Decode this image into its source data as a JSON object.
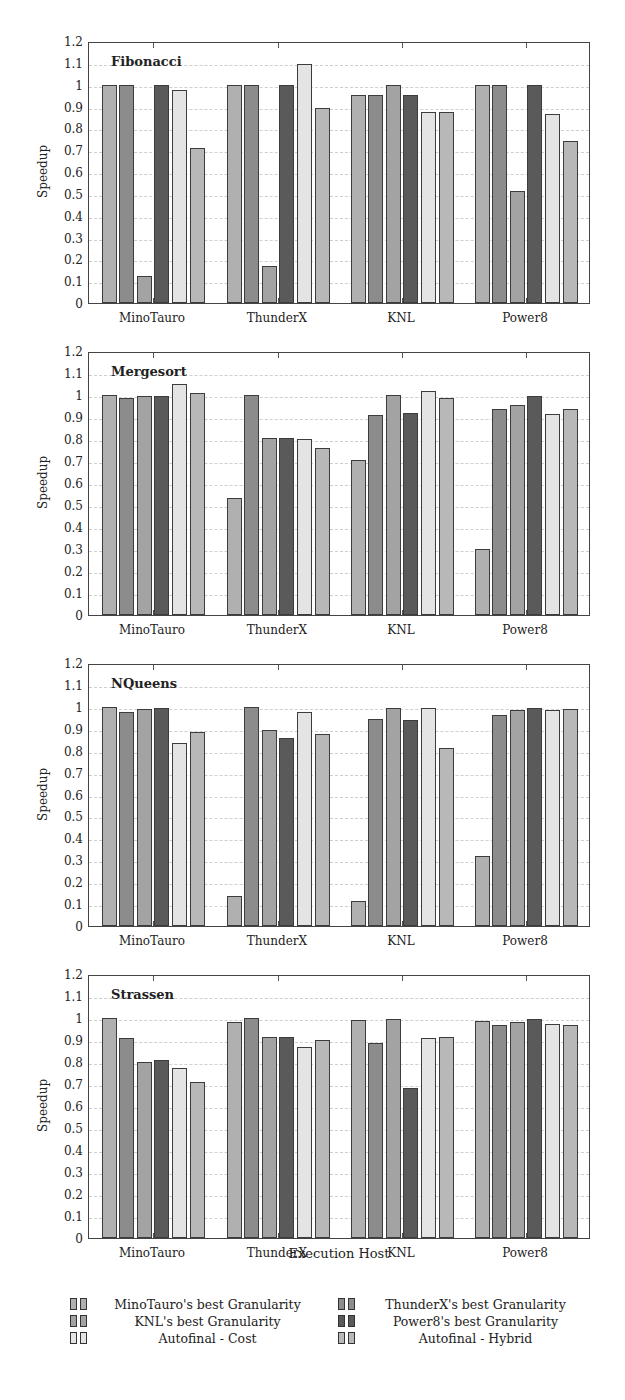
{
  "chart_data": [
    {
      "type": "bar",
      "title": "Fibonacci",
      "xlabel": "",
      "ylabel": "Speedup",
      "ylim": [
        0,
        1.2
      ],
      "yticks": [
        "0",
        "0.1",
        "0.2",
        "0.3",
        "0.4",
        "0.5",
        "0.6",
        "0.7",
        "0.8",
        "0.9",
        "1",
        "1.1",
        "1.2"
      ],
      "grid": true,
      "categories": [
        "MinoTauro",
        "ThunderX",
        "KNL",
        "Power8"
      ],
      "series": [
        {
          "name": "MinoTauro's best Granularity",
          "values": [
            1.0,
            1.0,
            0.955,
            1.0
          ]
        },
        {
          "name": "ThunderX's best Granularity",
          "values": [
            1.0,
            1.0,
            0.955,
            1.0
          ]
        },
        {
          "name": "KNL's best Granularity",
          "values": [
            0.125,
            0.17,
            1.0,
            0.515
          ]
        },
        {
          "name": "Power8's best Granularity",
          "values": [
            1.0,
            1.0,
            0.955,
            1.0
          ]
        },
        {
          "name": "Autofinal - Cost",
          "values": [
            0.975,
            1.095,
            0.875,
            0.865
          ]
        },
        {
          "name": "Autofinal - Hybrid",
          "values": [
            0.71,
            0.895,
            0.875,
            0.74
          ]
        }
      ]
    },
    {
      "type": "bar",
      "title": "Mergesort",
      "xlabel": "",
      "ylabel": "Speedup",
      "ylim": [
        0,
        1.2
      ],
      "yticks": [
        "0",
        "0.1",
        "0.2",
        "0.3",
        "0.4",
        "0.5",
        "0.6",
        "0.7",
        "0.8",
        "0.9",
        "1",
        "1.1",
        "1.2"
      ],
      "grid": true,
      "categories": [
        "MinoTauro",
        "ThunderX",
        "KNL",
        "Power8"
      ],
      "series": [
        {
          "name": "MinoTauro's best Granularity",
          "values": [
            1.0,
            0.53,
            0.705,
            0.3
          ]
        },
        {
          "name": "ThunderX's best Granularity",
          "values": [
            0.985,
            1.0,
            0.91,
            0.935
          ]
        },
        {
          "name": "KNL's best Granularity",
          "values": [
            0.997,
            0.805,
            1.0,
            0.955
          ]
        },
        {
          "name": "Power8's best Granularity",
          "values": [
            0.997,
            0.805,
            0.92,
            0.995
          ]
        },
        {
          "name": "Autofinal - Cost",
          "values": [
            1.05,
            0.8,
            1.02,
            0.915
          ]
        },
        {
          "name": "Autofinal - Hybrid",
          "values": [
            1.01,
            0.76,
            0.985,
            0.935
          ]
        }
      ]
    },
    {
      "type": "bar",
      "title": "NQueens",
      "xlabel": "",
      "ylabel": "Speedup",
      "ylim": [
        0,
        1.2
      ],
      "yticks": [
        "0",
        "0.1",
        "0.2",
        "0.3",
        "0.4",
        "0.5",
        "0.6",
        "0.7",
        "0.8",
        "0.9",
        "1",
        "1.1",
        "1.2"
      ],
      "grid": true,
      "categories": [
        "MinoTauro",
        "ThunderX",
        "KNL",
        "Power8"
      ],
      "series": [
        {
          "name": "MinoTauro's best Granularity",
          "values": [
            1.0,
            0.135,
            0.115,
            0.32
          ]
        },
        {
          "name": "ThunderX's best Granularity",
          "values": [
            0.975,
            1.0,
            0.945,
            0.965
          ]
        },
        {
          "name": "KNL's best Granularity",
          "values": [
            0.99,
            0.895,
            0.995,
            0.985
          ]
        },
        {
          "name": "Power8's best Granularity",
          "values": [
            0.995,
            0.86,
            0.94,
            0.995
          ]
        },
        {
          "name": "Autofinal - Cost",
          "values": [
            0.835,
            0.975,
            0.995,
            0.985
          ]
        },
        {
          "name": "Autofinal - Hybrid",
          "values": [
            0.885,
            0.875,
            0.81,
            0.99
          ]
        }
      ]
    },
    {
      "type": "bar",
      "title": "Strassen",
      "xlabel": "Execution Host",
      "ylabel": "Speedup",
      "ylim": [
        0,
        1.2
      ],
      "yticks": [
        "0",
        "0.1",
        "0.2",
        "0.3",
        "0.4",
        "0.5",
        "0.6",
        "0.7",
        "0.8",
        "0.9",
        "1",
        "1.1",
        "1.2"
      ],
      "grid": true,
      "categories": [
        "MinoTauro",
        "ThunderX",
        "KNL",
        "Power8"
      ],
      "series": [
        {
          "name": "MinoTauro's best Granularity",
          "values": [
            1.0,
            0.98,
            0.99,
            0.985
          ]
        },
        {
          "name": "ThunderX's best Granularity",
          "values": [
            0.91,
            1.0,
            0.885,
            0.97
          ]
        },
        {
          "name": "KNL's best Granularity",
          "values": [
            0.8,
            0.915,
            0.995,
            0.98
          ]
        },
        {
          "name": "Power8's best Granularity",
          "values": [
            0.81,
            0.915,
            0.68,
            0.995
          ]
        },
        {
          "name": "Autofinal - Cost",
          "values": [
            0.775,
            0.87,
            0.91,
            0.975
          ]
        },
        {
          "name": "Autofinal - Hybrid",
          "values": [
            0.71,
            0.9,
            0.915,
            0.97
          ]
        }
      ]
    }
  ],
  "series_colors": [
    "#b0b0b0",
    "#8c8c8c",
    "#a3a3a3",
    "#5a5a5a",
    "#e4e4e4",
    "#b8b8b8"
  ],
  "legend": {
    "position": "bottom",
    "items": [
      "MinoTauro's best Granularity",
      "ThunderX's best Granularity",
      "KNL's best Granularity",
      "Power8's best Granularity",
      "Autofinal - Cost",
      "Autofinal - Hybrid"
    ]
  },
  "x_axis_title": "Execution Host"
}
